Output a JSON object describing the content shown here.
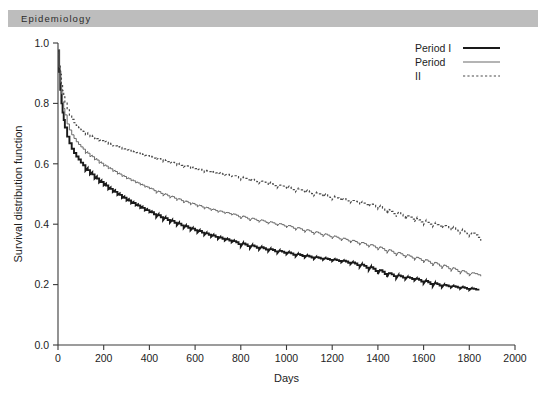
{
  "banner": {
    "journal": "Epidemiology"
  },
  "chart_data": {
    "type": "line",
    "title": "",
    "xlabel": "Days",
    "ylabel": "Survival distribution function",
    "xlim": [
      0,
      2000
    ],
    "ylim": [
      0.0,
      1.0
    ],
    "xticks": [
      0,
      200,
      400,
      600,
      800,
      1000,
      1200,
      1400,
      1600,
      1800,
      2000
    ],
    "xtick_labels": [
      "0",
      "200",
      "400",
      "600",
      "800",
      "1000",
      "1200",
      "1400",
      "1600",
      "1800",
      "2000"
    ],
    "yticks": [
      0.0,
      0.2,
      0.4,
      0.6,
      0.8,
      1.0
    ],
    "ytick_labels": [
      "0.0",
      "0.2",
      "0.4",
      "0.6",
      "0.8",
      "1.0"
    ],
    "grid": false,
    "legend_position": "top-right",
    "legend": [
      {
        "label": "Period I",
        "style": "solid-thick",
        "color": "#1a1a1a"
      },
      {
        "label": "Period",
        "style": "solid-thin",
        "color": "#6a6a6a"
      },
      {
        "label": "II",
        "style": "dotted",
        "color": "#4a4a4a"
      }
    ],
    "series": [
      {
        "name": "Period I",
        "style": "solid-thick",
        "color": "#1a1a1a",
        "x": [
          0,
          5,
          10,
          15,
          20,
          25,
          30,
          40,
          50,
          60,
          70,
          80,
          90,
          100,
          120,
          140,
          160,
          180,
          200,
          220,
          240,
          260,
          280,
          300,
          320,
          340,
          360,
          380,
          400,
          430,
          460,
          490,
          520,
          550,
          580,
          610,
          640,
          670,
          700,
          730,
          760,
          800,
          840,
          880,
          920,
          960,
          1000,
          1040,
          1080,
          1120,
          1160,
          1200,
          1240,
          1280,
          1320,
          1360,
          1400,
          1440,
          1480,
          1520,
          1560,
          1600,
          1640,
          1680,
          1720,
          1760,
          1800,
          1840
        ],
        "y": [
          0.975,
          0.905,
          0.845,
          0.8,
          0.77,
          0.745,
          0.72,
          0.69,
          0.668,
          0.65,
          0.636,
          0.624,
          0.614,
          0.604,
          0.586,
          0.572,
          0.558,
          0.545,
          0.534,
          0.522,
          0.512,
          0.502,
          0.492,
          0.483,
          0.474,
          0.466,
          0.458,
          0.45,
          0.443,
          0.433,
          0.423,
          0.414,
          0.405,
          0.396,
          0.388,
          0.38,
          0.372,
          0.365,
          0.358,
          0.352,
          0.346,
          0.338,
          0.331,
          0.325,
          0.319,
          0.313,
          0.308,
          0.302,
          0.297,
          0.292,
          0.288,
          0.284,
          0.28,
          0.275,
          0.268,
          0.26,
          0.25,
          0.24,
          0.232,
          0.226,
          0.221,
          0.214,
          0.206,
          0.2,
          0.196,
          0.192,
          0.188,
          0.185
        ]
      },
      {
        "name": "Period",
        "style": "solid-thin",
        "color": "#6a6a6a",
        "x": [
          0,
          5,
          10,
          15,
          20,
          25,
          30,
          40,
          50,
          60,
          70,
          80,
          90,
          100,
          120,
          140,
          160,
          180,
          200,
          220,
          240,
          260,
          280,
          300,
          320,
          340,
          360,
          380,
          400,
          430,
          460,
          490,
          520,
          550,
          580,
          610,
          640,
          670,
          700,
          730,
          760,
          800,
          840,
          880,
          920,
          960,
          1000,
          1040,
          1080,
          1120,
          1160,
          1200,
          1240,
          1280,
          1320,
          1360,
          1400,
          1440,
          1480,
          1520,
          1560,
          1600,
          1640,
          1680,
          1720,
          1760,
          1800,
          1850
        ],
        "y": [
          0.978,
          0.92,
          0.87,
          0.832,
          0.805,
          0.783,
          0.762,
          0.732,
          0.712,
          0.696,
          0.684,
          0.673,
          0.664,
          0.656,
          0.641,
          0.629,
          0.618,
          0.607,
          0.597,
          0.588,
          0.579,
          0.57,
          0.562,
          0.554,
          0.547,
          0.54,
          0.533,
          0.526,
          0.52,
          0.511,
          0.502,
          0.494,
          0.486,
          0.478,
          0.471,
          0.464,
          0.457,
          0.451,
          0.445,
          0.44,
          0.435,
          0.428,
          0.421,
          0.415,
          0.409,
          0.403,
          0.397,
          0.39,
          0.383,
          0.376,
          0.369,
          0.362,
          0.355,
          0.348,
          0.341,
          0.334,
          0.326,
          0.317,
          0.308,
          0.3,
          0.292,
          0.284,
          0.275,
          0.266,
          0.257,
          0.248,
          0.24,
          0.235
        ]
      },
      {
        "name": "II",
        "style": "dotted",
        "color": "#4a4a4a",
        "x": [
          0,
          5,
          10,
          15,
          20,
          25,
          30,
          40,
          50,
          60,
          70,
          80,
          90,
          100,
          120,
          140,
          160,
          180,
          200,
          220,
          240,
          260,
          280,
          300,
          320,
          340,
          360,
          380,
          400,
          430,
          460,
          490,
          520,
          550,
          580,
          610,
          640,
          670,
          700,
          730,
          760,
          800,
          840,
          880,
          920,
          960,
          1000,
          1040,
          1080,
          1120,
          1160,
          1200,
          1240,
          1280,
          1320,
          1360,
          1400,
          1440,
          1480,
          1520,
          1560,
          1600,
          1640,
          1680,
          1720,
          1760,
          1800,
          1850
        ],
        "y": [
          0.962,
          0.93,
          0.896,
          0.866,
          0.842,
          0.822,
          0.804,
          0.779,
          0.761,
          0.747,
          0.736,
          0.727,
          0.72,
          0.713,
          0.702,
          0.694,
          0.687,
          0.68,
          0.674,
          0.668,
          0.662,
          0.657,
          0.652,
          0.647,
          0.642,
          0.638,
          0.633,
          0.629,
          0.625,
          0.619,
          0.613,
          0.607,
          0.601,
          0.595,
          0.589,
          0.584,
          0.578,
          0.574,
          0.57,
          0.566,
          0.562,
          0.556,
          0.55,
          0.544,
          0.538,
          0.531,
          0.525,
          0.518,
          0.512,
          0.505,
          0.499,
          0.492,
          0.486,
          0.48,
          0.474,
          0.468,
          0.461,
          0.45,
          0.44,
          0.43,
          0.421,
          0.412,
          0.404,
          0.397,
          0.39,
          0.382,
          0.373,
          0.362
        ]
      }
    ]
  }
}
